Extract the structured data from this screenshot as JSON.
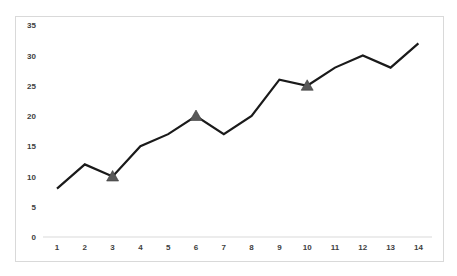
{
  "chart_data": {
    "type": "line",
    "title": "",
    "xlabel": "",
    "ylabel": "",
    "categories": [
      "1",
      "2",
      "3",
      "4",
      "5",
      "6",
      "7",
      "8",
      "9",
      "10",
      "11",
      "12",
      "13",
      "14"
    ],
    "series": [
      {
        "name": "Series 1",
        "values": [
          8,
          12,
          10,
          15,
          17,
          20,
          17,
          20,
          26,
          25,
          28,
          30,
          28,
          32
        ],
        "color": "#1a1a1a",
        "markers": [
          {
            "index": 2,
            "shape": "triangle",
            "color": "#595959"
          },
          {
            "index": 5,
            "shape": "triangle",
            "color": "#595959"
          },
          {
            "index": 9,
            "shape": "triangle",
            "color": "#595959"
          }
        ]
      }
    ],
    "yticks": [
      "0",
      "5",
      "10",
      "15",
      "20",
      "25",
      "30",
      "35"
    ],
    "ylim": [
      0,
      35
    ],
    "grid": false,
    "legend": "none"
  }
}
